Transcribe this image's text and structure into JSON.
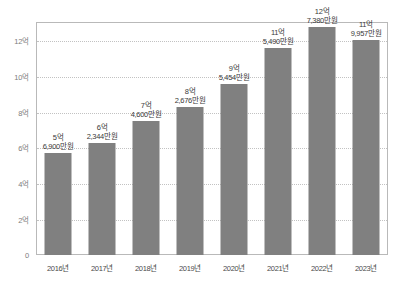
{
  "chart_data": {
    "type": "bar",
    "title": "",
    "subtitle": "",
    "xlabel": "",
    "ylabel": "",
    "categories": [
      "2016년",
      "2017년",
      "2018년",
      "2019년",
      "2020년",
      "2021년",
      "2022년",
      "2023년"
    ],
    "values": [
      5.69,
      6.2344,
      7.46,
      8.2676,
      9.5454,
      11.549,
      12.738,
      11.9957
    ],
    "value_labels": [
      {
        "top": "5억",
        "bottom": "6,900만원"
      },
      {
        "top": "6억",
        "bottom": "2,344만원"
      },
      {
        "top": "7억",
        "bottom": "4,600만원"
      },
      {
        "top": "8억",
        "bottom": "2,676만원"
      },
      {
        "top": "9억",
        "bottom": "5,454만원"
      },
      {
        "top": "11억",
        "bottom": "5,490만원"
      },
      {
        "top": "12억",
        "bottom": "7,380만원"
      },
      {
        "top": "11억",
        "bottom": "9,957만원"
      }
    ],
    "ylim": [
      0,
      13
    ],
    "yticks": [
      0,
      2,
      4,
      6,
      8,
      10,
      12
    ],
    "ytick_labels": [
      "0",
      "2억",
      "4억",
      "6억",
      "8억",
      "10억",
      "12억"
    ],
    "grid": true,
    "legend": false,
    "bar_color": "#808080",
    "grid_color": "#c2c2c2",
    "axis_color": "#b9b9b9"
  }
}
